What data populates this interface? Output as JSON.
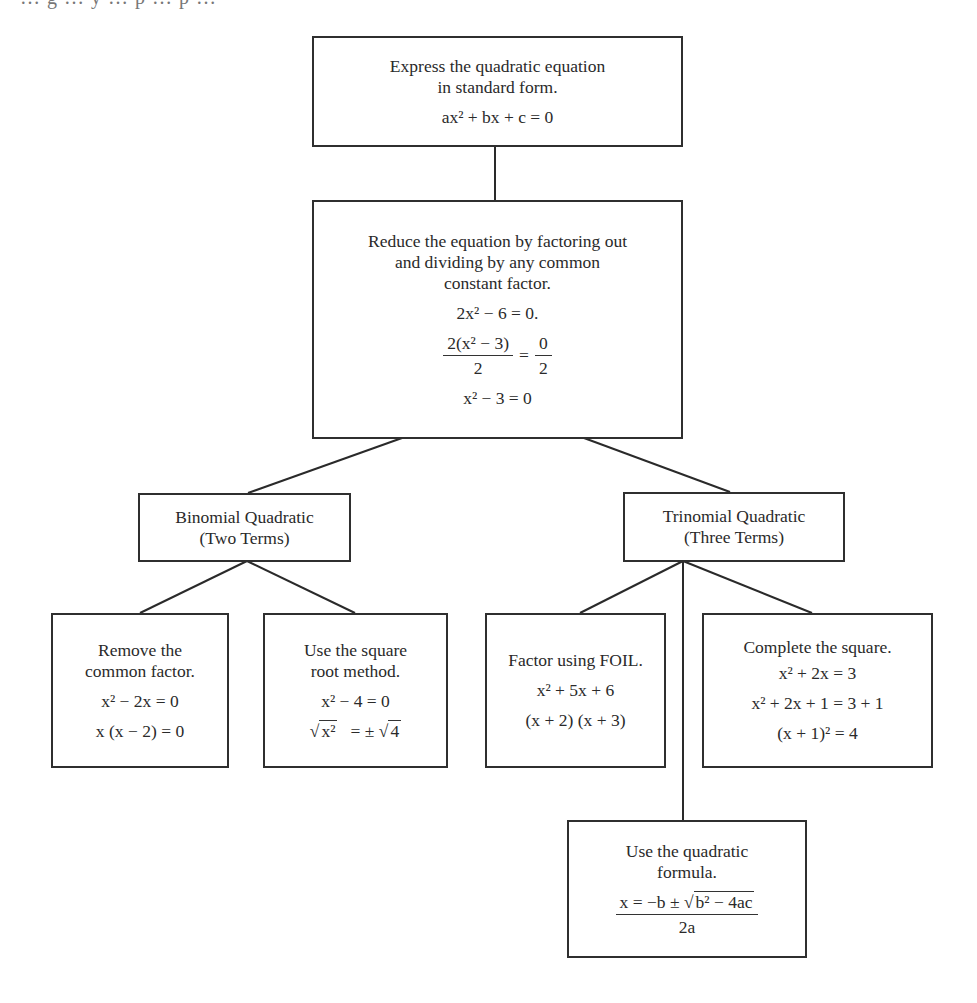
{
  "clipped_header_text": "… g … y … p … p …",
  "diagram": {
    "root": {
      "text": [
        "Express the quadratic equation",
        "in standard form."
      ],
      "equation": "ax² + bx + c = 0"
    },
    "reduce": {
      "text": [
        "Reduce the equation by factoring out",
        "and dividing by any common",
        "constant factor."
      ],
      "eq1": "2x² − 6 = 0.",
      "eq2_num": "2(x² − 3)",
      "eq2_den": "2",
      "eq2_eq": "=",
      "eq2_rnum": "0",
      "eq2_rden": "2",
      "eq3": "x² − 3 = 0"
    },
    "binomial": {
      "text": [
        "Binomial Quadratic",
        "(Two Terms)"
      ]
    },
    "trinomial": {
      "text": [
        "Trinomial Quadratic",
        "(Three Terms)"
      ]
    },
    "remove_common": {
      "text": [
        "Remove the",
        "common factor."
      ],
      "eq1": "x² − 2x = 0",
      "eq2": "x (x − 2) = 0"
    },
    "square_root": {
      "text": [
        "Use the square",
        "root method."
      ],
      "eq1": "x² − 4 = 0",
      "eq2_left": "x²",
      "eq2_mid": "= ±",
      "eq2_right": "4"
    },
    "foil": {
      "text": [
        "Factor using FOIL."
      ],
      "eq1": "x² + 5x + 6",
      "eq2": "(x + 2) (x + 3)"
    },
    "complete_square": {
      "text": [
        "Complete the square."
      ],
      "eq1": "x² + 2x = 3",
      "eq2": "x² + 2x + 1 = 3 + 1",
      "eq3": "(x + 1)² = 4"
    },
    "quadratic_formula": {
      "text": [
        "Use the quadratic",
        "formula."
      ],
      "num_left": "x = −b ±",
      "num_sqrt": "b² − 4ac",
      "den": "2a"
    }
  }
}
